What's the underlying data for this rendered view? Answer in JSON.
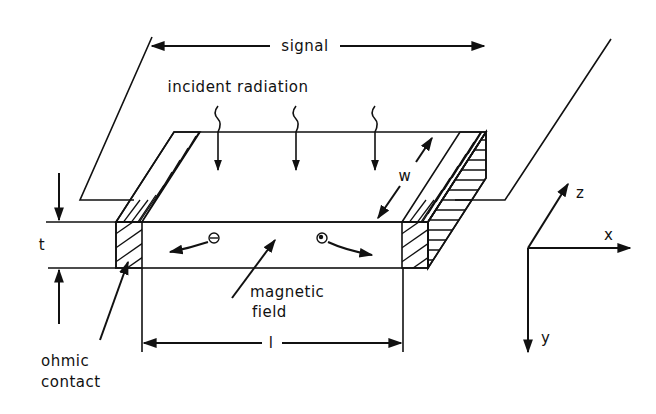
{
  "diagram": {
    "type": "photoconductor / photo-Hall effect sample schematic",
    "labels": {
      "signal": "signal",
      "incident_radiation": "incident radiation",
      "width": "w",
      "thickness": "t",
      "length": "l",
      "magnetic_field_line1": "magnetic",
      "magnetic_field_line2": "field",
      "ohmic_contact_line1": "ohmic",
      "ohmic_contact_line2": "contact",
      "axis_x": "x",
      "axis_y": "y",
      "axis_z": "z"
    },
    "carriers": [
      {
        "name": "electron",
        "symbol": "minus",
        "direction": "left"
      },
      {
        "name": "hole",
        "symbol": "plus",
        "direction": "right"
      }
    ],
    "radiation_arrows": 3,
    "colors": {
      "ink": "#111111",
      "background": "#ffffff"
    }
  }
}
